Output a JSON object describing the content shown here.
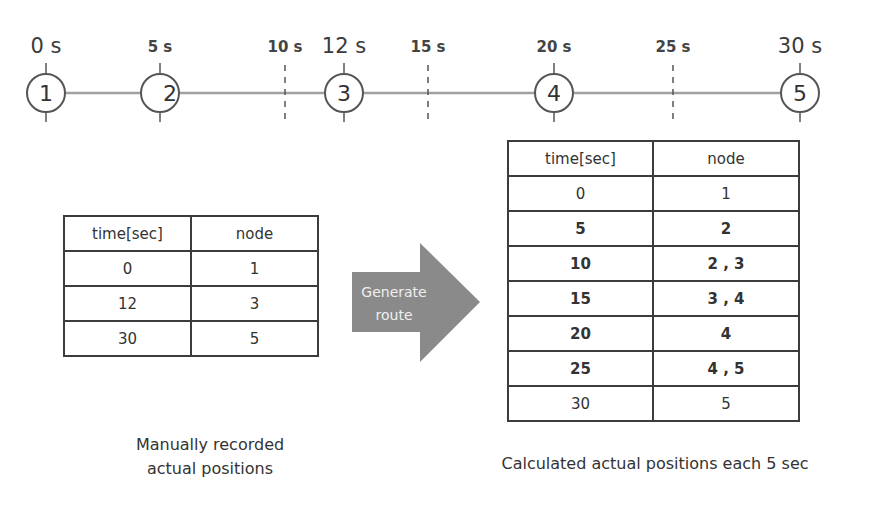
{
  "timeline": {
    "line_color": "#a0a0a0",
    "circle_color": "#555555",
    "tick_color": "#555555",
    "nodes": [
      {
        "id": "1",
        "time_label": "0 s",
        "x": 46
      },
      {
        "id": "2",
        "time_label": "5 s",
        "x": 160
      },
      {
        "id": "3",
        "time_label": "12 s",
        "x": 344
      },
      {
        "id": "4",
        "time_label": "20 s",
        "x": 554
      },
      {
        "id": "5",
        "time_label": "30 s",
        "x": 800
      }
    ],
    "dashed_ticks": [
      {
        "time_label": "10 s",
        "x": 285
      },
      {
        "time_label": "15 s",
        "x": 428
      },
      {
        "time_label": "25 s",
        "x": 673
      }
    ]
  },
  "manual_table": {
    "headers": [
      "time[sec]",
      "node"
    ],
    "rows": [
      [
        "0",
        "1"
      ],
      [
        "12",
        "3"
      ],
      [
        "30",
        "5"
      ]
    ],
    "caption_line1": "Manually recorded",
    "caption_line2": "actual positions"
  },
  "arrow": {
    "label_line1": "Generate",
    "label_line2": "route",
    "color": "#8a8a8a"
  },
  "calc_table": {
    "headers": [
      "time[sec]",
      "node"
    ],
    "rows": [
      {
        "time": "0",
        "node": "1",
        "bold": false
      },
      {
        "time": "5",
        "node": "2",
        "bold": true
      },
      {
        "time": "10",
        "node": "2 , 3",
        "bold": true
      },
      {
        "time": "15",
        "node": "3 , 4",
        "bold": true
      },
      {
        "time": "20",
        "node": "4",
        "bold": true
      },
      {
        "time": "25",
        "node": "4 , 5",
        "bold": true
      },
      {
        "time": "30",
        "node": "5",
        "bold": false
      }
    ],
    "caption": "Calculated actual positions each 5 sec"
  }
}
